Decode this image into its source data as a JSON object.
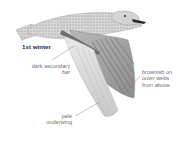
{
  "illustration": {
    "subject": "gull in flight",
    "age_label": "1st winter",
    "colors": {
      "body_light": "#d9d9d9",
      "body_mid": "#a8a8a8",
      "feather_dark": "#6e6e6e",
      "bill": "#2b2b2b",
      "label_text": "#6f6f6f",
      "title_text": "#2a2a2a"
    }
  },
  "annotations": [
    {
      "id": "secondary-bar",
      "lines": [
        "dark secondary",
        "bar"
      ]
    },
    {
      "id": "outer-webs",
      "lines": [
        "brownish on",
        "outer webs",
        "from above"
      ]
    },
    {
      "id": "underwing",
      "lines": [
        "pale",
        "underwing"
      ]
    }
  ]
}
